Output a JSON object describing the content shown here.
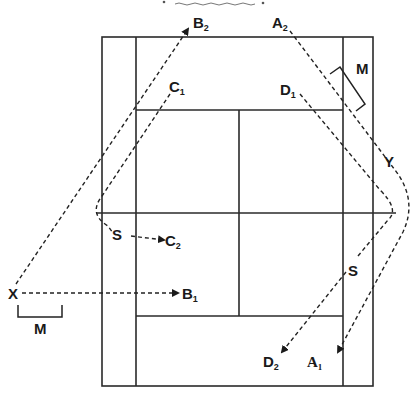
{
  "diagram": {
    "type": "badminton-court-shot-paths",
    "labels": {
      "A1": {
        "main": "A",
        "sub": "1"
      },
      "A2": {
        "main": "A",
        "sub": "2"
      },
      "B1": {
        "main": "B",
        "sub": "1"
      },
      "B2": {
        "main": "B",
        "sub": "2"
      },
      "C1": {
        "main": "C",
        "sub": "1"
      },
      "C2": {
        "main": "C",
        "sub": "2"
      },
      "D1": {
        "main": "D",
        "sub": "1"
      },
      "D2": {
        "main": "D",
        "sub": "2"
      },
      "X": "X",
      "Y": "Y",
      "S_left": "S",
      "S_right": "S",
      "M_right": "M",
      "M_left": "M"
    },
    "paths": [
      {
        "name": "X-to-B2",
        "from": "X",
        "to": "B2"
      },
      {
        "name": "X-to-B1",
        "from": "X",
        "to": "B1"
      },
      {
        "name": "C1-to-C2",
        "from": "C1",
        "via": "S",
        "to": "C2"
      },
      {
        "name": "A2-to-A1",
        "from": "A2",
        "via": "Y",
        "to": "A1"
      },
      {
        "name": "D1-to-D2",
        "from": "D1",
        "via": "S",
        "to": "D2"
      }
    ],
    "colors": {
      "line": "#2a2a2a",
      "background": "#ffffff"
    }
  }
}
